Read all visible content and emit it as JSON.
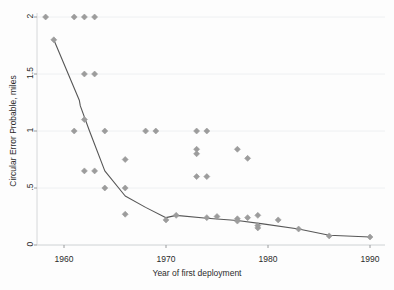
{
  "chart_data": {
    "type": "scatter",
    "title": "",
    "subtitle": "",
    "xlabel": "Year of first deployment",
    "ylabel": "Circular Error Probable, miles",
    "xlim": [
      1957.5,
      1991.0
    ],
    "ylim": [
      0,
      2.05
    ],
    "xticks": [
      1960,
      1970,
      1980,
      1990
    ],
    "xtick_labels": [
      "1960",
      "1970",
      "1980",
      "1990"
    ],
    "yticks": [
      0,
      0.5,
      1,
      1.5,
      2
    ],
    "ytick_labels": [
      "0",
      ".5",
      "1",
      "1.5",
      "2"
    ],
    "grid": "horizontal",
    "legend": "none",
    "marker": "diamond",
    "marker_color": "#9c9c9c",
    "line_color": "#575757",
    "background_color": "#fdfdfd",
    "series": [
      {
        "name": "Circular Error Probable observations",
        "type": "scatter",
        "points": [
          {
            "x": 1958.2,
            "y": 2.0
          },
          {
            "x": 1959.0,
            "y": 1.8
          },
          {
            "x": 1961.0,
            "y": 2.0
          },
          {
            "x": 1961.0,
            "y": 1.0
          },
          {
            "x": 1962.0,
            "y": 2.0
          },
          {
            "x": 1962.0,
            "y": 1.5
          },
          {
            "x": 1962.0,
            "y": 1.1
          },
          {
            "x": 1962.0,
            "y": 0.65
          },
          {
            "x": 1963.0,
            "y": 2.0
          },
          {
            "x": 1963.0,
            "y": 1.5
          },
          {
            "x": 1963.0,
            "y": 0.65
          },
          {
            "x": 1964.0,
            "y": 1.0
          },
          {
            "x": 1964.0,
            "y": 0.5
          },
          {
            "x": 1966.0,
            "y": 0.75
          },
          {
            "x": 1966.0,
            "y": 0.5
          },
          {
            "x": 1966.0,
            "y": 0.27
          },
          {
            "x": 1968.0,
            "y": 1.0
          },
          {
            "x": 1969.0,
            "y": 1.0
          },
          {
            "x": 1970.0,
            "y": 0.22
          },
          {
            "x": 1971.0,
            "y": 0.26
          },
          {
            "x": 1973.0,
            "y": 1.0
          },
          {
            "x": 1973.0,
            "y": 0.84
          },
          {
            "x": 1973.0,
            "y": 0.8
          },
          {
            "x": 1973.0,
            "y": 0.6
          },
          {
            "x": 1974.0,
            "y": 1.0
          },
          {
            "x": 1974.0,
            "y": 0.6
          },
          {
            "x": 1974.0,
            "y": 0.24
          },
          {
            "x": 1975.0,
            "y": 0.25
          },
          {
            "x": 1977.0,
            "y": 0.84
          },
          {
            "x": 1977.0,
            "y": 0.23
          },
          {
            "x": 1977.0,
            "y": 0.21
          },
          {
            "x": 1978.0,
            "y": 0.76
          },
          {
            "x": 1978.0,
            "y": 0.24
          },
          {
            "x": 1979.0,
            "y": 0.26
          },
          {
            "x": 1979.0,
            "y": 0.17
          },
          {
            "x": 1979.0,
            "y": 0.15
          },
          {
            "x": 1981.0,
            "y": 0.22
          },
          {
            "x": 1983.0,
            "y": 0.14
          },
          {
            "x": 1986.0,
            "y": 0.08
          },
          {
            "x": 1990.0,
            "y": 0.07
          }
        ]
      },
      {
        "name": "Trend line",
        "type": "line",
        "points": [
          {
            "x": 1959.0,
            "y": 1.8
          },
          {
            "x": 1961.5,
            "y": 1.27
          },
          {
            "x": 1961.6,
            "y": 1.22
          },
          {
            "x": 1962.5,
            "y": 1.0
          },
          {
            "x": 1964.0,
            "y": 0.65
          },
          {
            "x": 1966.0,
            "y": 0.43
          },
          {
            "x": 1968.0,
            "y": 0.33
          },
          {
            "x": 1970.0,
            "y": 0.24
          },
          {
            "x": 1971.0,
            "y": 0.26
          },
          {
            "x": 1974.0,
            "y": 0.235
          },
          {
            "x": 1977.0,
            "y": 0.215
          },
          {
            "x": 1979.5,
            "y": 0.185
          },
          {
            "x": 1983.0,
            "y": 0.14
          },
          {
            "x": 1986.0,
            "y": 0.085
          },
          {
            "x": 1990.0,
            "y": 0.07
          }
        ]
      }
    ]
  }
}
